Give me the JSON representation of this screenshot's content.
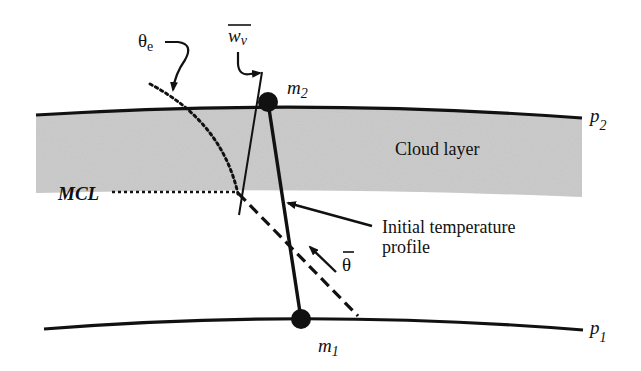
{
  "diagram": {
    "type": "atmospheric cloud layer mixing diagram",
    "colors": {
      "background": "#ffffff",
      "ink": "#111111",
      "cloud_fill": "#c4c4c4"
    },
    "cloud_layer": {
      "label": "Cloud layer"
    },
    "levels": {
      "top": {
        "symbol": "p",
        "subscript": "2"
      },
      "bottom": {
        "symbol": "p",
        "subscript": "1"
      }
    },
    "points": {
      "upper": {
        "symbol": "m",
        "subscript": "2"
      },
      "lower": {
        "symbol": "m",
        "subscript": "1"
      }
    },
    "labels": {
      "theta_e": {
        "symbol": "θ",
        "subscript": "e"
      },
      "w_v_bar": {
        "symbol": "w",
        "subscript": "v"
      },
      "mcl": "MCL",
      "theta_bar": "θ",
      "initial_profile_line1": "Initial temperature",
      "initial_profile_line2": "profile"
    }
  }
}
